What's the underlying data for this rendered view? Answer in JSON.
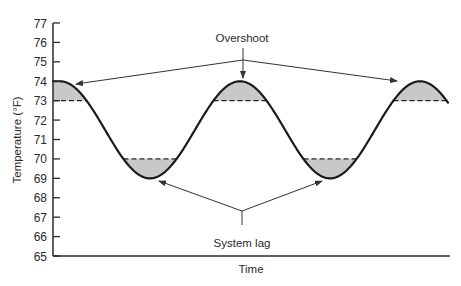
{
  "chart_data": {
    "type": "line",
    "title": "",
    "xlabel": "Time",
    "ylabel": "Temperature (°F)",
    "ylim": [
      65,
      77
    ],
    "yticks": [
      65,
      66,
      67,
      68,
      69,
      70,
      71,
      72,
      73,
      74,
      75,
      76,
      77
    ],
    "grid": false,
    "legend": null,
    "series": [
      {
        "name": "Room temperature",
        "description": "Sinusoidal oscillation between 69°F and 74°F",
        "x_relative": [
          0.0,
          0.25,
          0.5,
          0.75,
          1.0,
          1.25,
          1.5,
          1.75,
          2.0,
          2.2
        ],
        "values": [
          74,
          71.5,
          69,
          71.5,
          74,
          71.5,
          69,
          71.5,
          74,
          72.8
        ]
      }
    ],
    "reference_lines": [
      {
        "style": "dashed",
        "value": 73,
        "role": "upper setpoint (overshoot threshold)"
      },
      {
        "style": "dashed",
        "value": 70,
        "role": "lower setpoint (system lag threshold)"
      }
    ],
    "shaded_regions": [
      {
        "kind": "overshoot",
        "from": 73,
        "to": 74,
        "count": 3
      },
      {
        "kind": "system lag",
        "from": 69,
        "to": 70,
        "count": 2
      }
    ],
    "annotations": [
      {
        "text": "Overshoot",
        "points_to": "three peaks above 73°F"
      },
      {
        "text": "System lag",
        "points_to": "two troughs below 70°F"
      }
    ]
  },
  "labels": {
    "y_axis_title": "Temperature (°F)",
    "x_axis_title": "Time",
    "overshoot": "Overshoot",
    "system_lag": "System lag",
    "ticks": [
      "77",
      "76",
      "75",
      "74",
      "73",
      "72",
      "71",
      "70",
      "69",
      "68",
      "67",
      "66",
      "65"
    ]
  },
  "colors": {
    "curve": "#1a1a1a",
    "shade": "#c8c8c8",
    "axis": "#2a2a2a",
    "arrow": "#333333"
  }
}
